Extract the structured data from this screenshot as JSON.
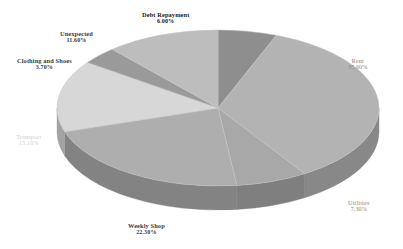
{
  "chart_data": {
    "type": "pie",
    "title": "",
    "subtitle": "",
    "xlabel": "",
    "ylabel": "",
    "legend_position": "none",
    "grid": false,
    "three_d": true,
    "rotation_deg": 0,
    "categories": [
      "Debt Repayment",
      "Rent",
      "Utilities",
      "Weekly Shop",
      "Transport",
      "Clothing and Shoes",
      "Unexpected"
    ],
    "values": [
      6.0,
      35.6,
      7.3,
      22.3,
      15.1,
      3.7,
      11.6
    ],
    "value_labels": [
      "6.00%",
      "35.60%",
      "7.30%",
      "22.30%",
      "15.10%",
      "3.70%",
      "11.60%"
    ],
    "slices": [
      {
        "name": "Debt Repayment",
        "value": 6.0,
        "value_label": "6.00%",
        "color": "#8e8e8e",
        "side_color": "#6d6d6d",
        "label_style": "dark",
        "label_x": 142,
        "label_y": 11
      },
      {
        "name": "Rent",
        "value": 35.6,
        "value_label": "35.60%",
        "color": "#b3b3b3",
        "side_color": "#888888",
        "label_style": "gray",
        "label_x": 348,
        "label_y": 57
      },
      {
        "name": "Utilities",
        "value": 7.3,
        "value_label": "7.30%",
        "color": "#a8a8a8",
        "side_color": "#7f7f7f",
        "label_style": "gray",
        "label_x": 348,
        "label_y": 199
      },
      {
        "name": "Weekly Shop",
        "value": 22.3,
        "value_label": "22.30%",
        "color": "#aeaeae",
        "side_color": "#838383",
        "label_style": "mid",
        "label_x": 128,
        "label_y": 222
      },
      {
        "name": "Transport",
        "value": 15.1,
        "value_label": "15.10%",
        "color": "#d7d7d7",
        "side_color": "#a3a3a3",
        "label_style": "faint",
        "label_x": 16,
        "label_y": 133
      },
      {
        "name": "Clothing and Shoes",
        "value": 3.7,
        "value_label": "3.70%",
        "color": "#9a9a9a",
        "side_color": "#757575",
        "label_style": "mid",
        "label_x": 17,
        "label_y": 57
      },
      {
        "name": "Unexpected",
        "value": 11.6,
        "value_label": "11.60%",
        "color": "#bdbdbd",
        "side_color": "#8f8f8f",
        "label_style": "mid",
        "label_x": 60,
        "label_y": 30
      }
    ],
    "geometry": {
      "center_x": 218,
      "center_y": 108,
      "radius_x": 161,
      "radius_y": 78,
      "depth": 24
    },
    "background_color": "#ffffff"
  }
}
